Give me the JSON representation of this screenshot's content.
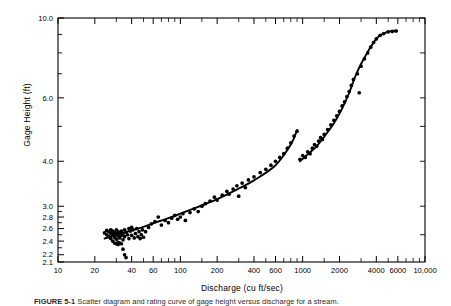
{
  "figure": {
    "caption_label": "FIGURE 5-1",
    "caption_text": "Scatter diagram and rating curve of gage height versus discharge for a stream."
  },
  "axes": {
    "y_title": "Gage Height (ft)",
    "x_title": "Discharge (cu ft/sec)",
    "y_ticks": [
      "10.0",
      "6.0",
      "4.0",
      "3.0",
      "2.8",
      "2.6",
      "2.4",
      "2.2",
      "2.1"
    ],
    "x_ticks": [
      "10",
      "20",
      "40",
      "60",
      "100",
      "200",
      "400",
      "600",
      "1000",
      "2000",
      "4000",
      "6000",
      "10,000"
    ]
  },
  "chart_data": {
    "type": "scatter",
    "title": "",
    "xlabel": "Discharge (cu ft/sec)",
    "ylabel": "Gage Height (ft)",
    "xscale": "log",
    "yscale": "log",
    "xlim": [
      10,
      10000
    ],
    "ylim": [
      2.1,
      10.0
    ],
    "grid": false,
    "legend": null,
    "xtick_values": [
      10,
      20,
      40,
      60,
      100,
      200,
      400,
      600,
      1000,
      2000,
      4000,
      6000,
      10000
    ],
    "xtick_labels": [
      "10",
      "20",
      "40",
      "60",
      "100",
      "200",
      "400",
      "600",
      "1000",
      "2000",
      "4000",
      "6000",
      "10,000"
    ],
    "ytick_values": [
      10.0,
      6.0,
      4.0,
      3.0,
      2.8,
      2.6,
      2.4,
      2.2,
      2.1
    ],
    "ytick_labels": [
      "10.0",
      "6.0",
      "4.0",
      "3.0",
      "2.8",
      "2.6",
      "2.4",
      "2.2",
      "2.1"
    ],
    "series": [
      {
        "name": "observations",
        "marker": "filled-circle",
        "color": "#000000",
        "points": [
          [
            24,
            2.53
          ],
          [
            25,
            2.5
          ],
          [
            25,
            2.57
          ],
          [
            26,
            2.55
          ],
          [
            26,
            2.47
          ],
          [
            27,
            2.58
          ],
          [
            27,
            2.52
          ],
          [
            27,
            2.44
          ],
          [
            28,
            2.56
          ],
          [
            28,
            2.5
          ],
          [
            28,
            2.4
          ],
          [
            29,
            2.54
          ],
          [
            29,
            2.46
          ],
          [
            29,
            2.37
          ],
          [
            30,
            2.58
          ],
          [
            30,
            2.51
          ],
          [
            30,
            2.43
          ],
          [
            30,
            2.36
          ],
          [
            31,
            2.55
          ],
          [
            31,
            2.48
          ],
          [
            31,
            2.38
          ],
          [
            31,
            2.35
          ],
          [
            32,
            2.53
          ],
          [
            32,
            2.45
          ],
          [
            32,
            2.37
          ],
          [
            33,
            2.56
          ],
          [
            33,
            2.49
          ],
          [
            33,
            2.36
          ],
          [
            34,
            2.52
          ],
          [
            34,
            2.42
          ],
          [
            34,
            2.28
          ],
          [
            35,
            2.58
          ],
          [
            35,
            2.47
          ],
          [
            35,
            2.2
          ],
          [
            36,
            2.54
          ],
          [
            36,
            2.16
          ],
          [
            37,
            2.5
          ],
          [
            38,
            2.6
          ],
          [
            38,
            2.44
          ],
          [
            39,
            2.56
          ],
          [
            40,
            2.62
          ],
          [
            40,
            2.49
          ],
          [
            41,
            2.58
          ],
          [
            42,
            2.45
          ],
          [
            43,
            2.52
          ],
          [
            44,
            2.6
          ],
          [
            45,
            2.47
          ],
          [
            46,
            2.55
          ],
          [
            47,
            2.44
          ],
          [
            48,
            2.5
          ],
          [
            49,
            2.58
          ],
          [
            50,
            2.46
          ],
          [
            52,
            2.55
          ],
          [
            55,
            2.62
          ],
          [
            58,
            2.68
          ],
          [
            62,
            2.72
          ],
          [
            66,
            2.8
          ],
          [
            70,
            2.66
          ],
          [
            75,
            2.74
          ],
          [
            80,
            2.7
          ],
          [
            85,
            2.78
          ],
          [
            90,
            2.83
          ],
          [
            95,
            2.76
          ],
          [
            100,
            2.8
          ],
          [
            105,
            2.86
          ],
          [
            110,
            2.74
          ],
          [
            120,
            2.88
          ],
          [
            130,
            2.95
          ],
          [
            140,
            2.9
          ],
          [
            150,
            3.0
          ],
          [
            160,
            3.05
          ],
          [
            175,
            3.1
          ],
          [
            190,
            3.18
          ],
          [
            200,
            3.12
          ],
          [
            220,
            3.22
          ],
          [
            240,
            3.3
          ],
          [
            250,
            3.24
          ],
          [
            270,
            3.35
          ],
          [
            290,
            3.42
          ],
          [
            300,
            3.2
          ],
          [
            320,
            3.48
          ],
          [
            340,
            3.38
          ],
          [
            360,
            3.55
          ],
          [
            400,
            3.62
          ],
          [
            450,
            3.72
          ],
          [
            500,
            3.8
          ],
          [
            550,
            3.9
          ],
          [
            600,
            4.0
          ],
          [
            650,
            4.1
          ],
          [
            700,
            4.2
          ],
          [
            750,
            4.35
          ],
          [
            800,
            4.5
          ],
          [
            850,
            4.7
          ],
          [
            900,
            4.85
          ],
          [
            950,
            4.05
          ],
          [
            1000,
            4.15
          ],
          [
            1050,
            4.1
          ],
          [
            1100,
            4.25
          ],
          [
            1150,
            4.2
          ],
          [
            1200,
            4.35
          ],
          [
            1250,
            4.45
          ],
          [
            1300,
            4.4
          ],
          [
            1350,
            4.55
          ],
          [
            1400,
            4.65
          ],
          [
            1450,
            4.6
          ],
          [
            1500,
            4.75
          ],
          [
            1600,
            4.9
          ],
          [
            1700,
            5.05
          ],
          [
            1800,
            5.2
          ],
          [
            1900,
            5.35
          ],
          [
            2000,
            5.5
          ],
          [
            2100,
            5.7
          ],
          [
            2200,
            5.85
          ],
          [
            2300,
            6.05
          ],
          [
            2400,
            6.25
          ],
          [
            2500,
            6.5
          ],
          [
            2600,
            6.75
          ],
          [
            2800,
            7.0
          ],
          [
            2900,
            6.2
          ],
          [
            3000,
            7.35
          ],
          [
            3200,
            7.7
          ],
          [
            3400,
            8.0
          ],
          [
            3600,
            8.3
          ],
          [
            3800,
            8.55
          ],
          [
            4000,
            8.75
          ],
          [
            4300,
            8.95
          ],
          [
            4600,
            9.05
          ],
          [
            5000,
            9.15
          ],
          [
            5400,
            9.18
          ],
          [
            5800,
            9.2
          ]
        ]
      }
    ],
    "fitted_curves": [
      {
        "name": "rating-curve-lower",
        "description": "Lower-stage rating curve, 24 to 900 cu ft/sec",
        "points": [
          [
            24,
            2.44
          ],
          [
            30,
            2.5
          ],
          [
            40,
            2.57
          ],
          [
            50,
            2.63
          ],
          [
            60,
            2.69
          ],
          [
            80,
            2.78
          ],
          [
            100,
            2.86
          ],
          [
            140,
            2.99
          ],
          [
            200,
            3.14
          ],
          [
            300,
            3.36
          ],
          [
            400,
            3.54
          ],
          [
            600,
            3.9
          ],
          [
            800,
            4.45
          ],
          [
            900,
            4.88
          ]
        ]
      },
      {
        "name": "rating-curve-upper",
        "description": "Upper-stage rating curve, 950 to 6000 cu ft/sec, flattening at high discharge",
        "points": [
          [
            950,
            4.0
          ],
          [
            1100,
            4.18
          ],
          [
            1300,
            4.4
          ],
          [
            1500,
            4.68
          ],
          [
            1800,
            5.1
          ],
          [
            2100,
            5.6
          ],
          [
            2400,
            6.2
          ],
          [
            2700,
            6.9
          ],
          [
            3000,
            7.45
          ],
          [
            3400,
            8.05
          ],
          [
            3800,
            8.55
          ],
          [
            4200,
            8.9
          ],
          [
            4800,
            9.12
          ],
          [
            5400,
            9.2
          ],
          [
            5900,
            9.22
          ]
        ]
      }
    ],
    "annotations": [
      {
        "text": "Curve is discontinuous near 900-950 cu ft/sec"
      }
    ]
  }
}
